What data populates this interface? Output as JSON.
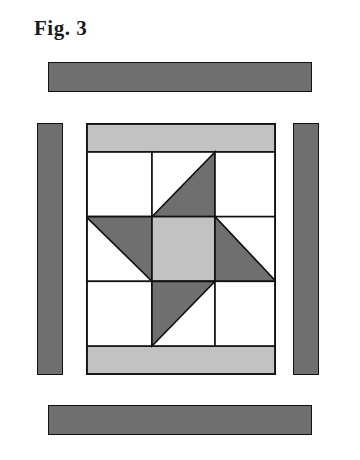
{
  "figure": {
    "label": "Fig. 3",
    "kind": "quilt-block-diagram"
  },
  "colors": {
    "dark_gray": "#6f6f6f",
    "medium_gray": "#7a7a7a",
    "light_gray": "#c2c2c2",
    "white": "#ffffff",
    "outline": "#111111",
    "background": "#ffffff",
    "text": "#1a1a1a"
  },
  "border_strips": [
    {
      "name": "top-border-strip",
      "fill": "#6f6f6f",
      "orientation": "horizontal",
      "position": "top"
    },
    {
      "name": "left-border-strip",
      "fill": "#6f6f6f",
      "orientation": "vertical",
      "position": "left"
    },
    {
      "name": "right-border-strip",
      "fill": "#6f6f6f",
      "orientation": "vertical",
      "position": "right"
    },
    {
      "name": "bottom-border-strip",
      "fill": "#6f6f6f",
      "orientation": "horizontal",
      "position": "bottom"
    }
  ],
  "block": {
    "name": "pinwheel-star-block",
    "top_sashing_fill": "#c2c2c2",
    "bottom_sashing_fill": "#c2c2c2",
    "grid": {
      "columns": 3,
      "rows": 3,
      "cells": [
        {
          "row": 0,
          "col": 0,
          "pattern": "plain",
          "fill": "#ffffff"
        },
        {
          "row": 0,
          "col": 1,
          "pattern": "half-square-triangle",
          "triangle_corner": "bottom-right",
          "triangle_fill": "#6f6f6f",
          "background_fill": "#ffffff"
        },
        {
          "row": 0,
          "col": 2,
          "pattern": "plain",
          "fill": "#ffffff"
        },
        {
          "row": 1,
          "col": 0,
          "pattern": "half-square-triangle",
          "triangle_corner": "top-right",
          "triangle_fill": "#6f6f6f",
          "background_fill": "#ffffff"
        },
        {
          "row": 1,
          "col": 1,
          "pattern": "plain",
          "fill": "#c2c2c2"
        },
        {
          "row": 1,
          "col": 2,
          "pattern": "half-square-triangle",
          "triangle_corner": "bottom-left",
          "triangle_fill": "#6f6f6f",
          "background_fill": "#ffffff"
        },
        {
          "row": 2,
          "col": 0,
          "pattern": "plain",
          "fill": "#ffffff"
        },
        {
          "row": 2,
          "col": 1,
          "pattern": "half-square-triangle",
          "triangle_corner": "top-left",
          "triangle_fill": "#6f6f6f",
          "background_fill": "#ffffff"
        },
        {
          "row": 2,
          "col": 2,
          "pattern": "plain",
          "fill": "#ffffff"
        }
      ]
    }
  }
}
